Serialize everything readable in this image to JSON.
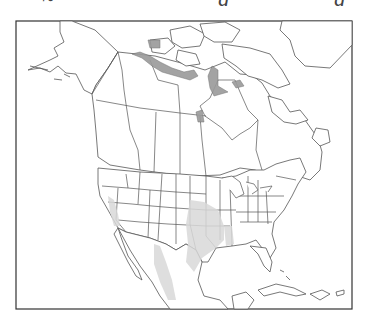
{
  "figure": {
    "type": "range-map",
    "region": "North America",
    "caption_fragment": "cropped text descenders (g, g) visible at top edge only",
    "frame": {
      "left": 16,
      "top": 21,
      "right": 352,
      "bottom": 309
    },
    "colors": {
      "outline": "#555555",
      "frame": "#333333",
      "range_dark": "#9a9a9a",
      "range_light": "#d8d8d8",
      "background": "#ffffff"
    }
  },
  "legend": {
    "range_dark": "Arctic coastal / Hudson Bay range (dark gray)",
    "range_light": "Southern range: California Central Valley, southern Great Plains to Texas, Mexico (light gray)"
  },
  "captions": {
    "glyph1": "g",
    "glyph2": "g"
  }
}
